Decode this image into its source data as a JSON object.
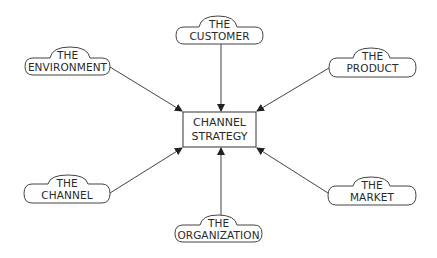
{
  "diagram": {
    "type": "hub-and-spoke",
    "center": {
      "line1": "CHANNEL",
      "line2": "STRATEGY"
    },
    "nodes": [
      {
        "id": "customer",
        "line1": "THE",
        "line2": "CUSTOMER",
        "position": "top"
      },
      {
        "id": "environment",
        "line1": "THE",
        "line2": "ENVIRONMENT",
        "position": "top-left"
      },
      {
        "id": "product",
        "line1": "THE",
        "line2": "PRODUCT",
        "position": "top-right"
      },
      {
        "id": "channel",
        "line1": "THE",
        "line2": "CHANNEL",
        "position": "bottom-left"
      },
      {
        "id": "organization",
        "line1": "THE",
        "line2": "ORGANIZATION",
        "position": "bottom"
      },
      {
        "id": "market",
        "line1": "THE",
        "line2": "MARKET",
        "position": "bottom-right"
      }
    ],
    "edges": [
      {
        "from": "customer",
        "to": "center"
      },
      {
        "from": "environment",
        "to": "center"
      },
      {
        "from": "product",
        "to": "center"
      },
      {
        "from": "channel",
        "to": "center"
      },
      {
        "from": "organization",
        "to": "center"
      },
      {
        "from": "market",
        "to": "center"
      }
    ],
    "colors": {
      "stroke": "#333333",
      "text": "#2a2a2a",
      "background": "#ffffff"
    }
  }
}
